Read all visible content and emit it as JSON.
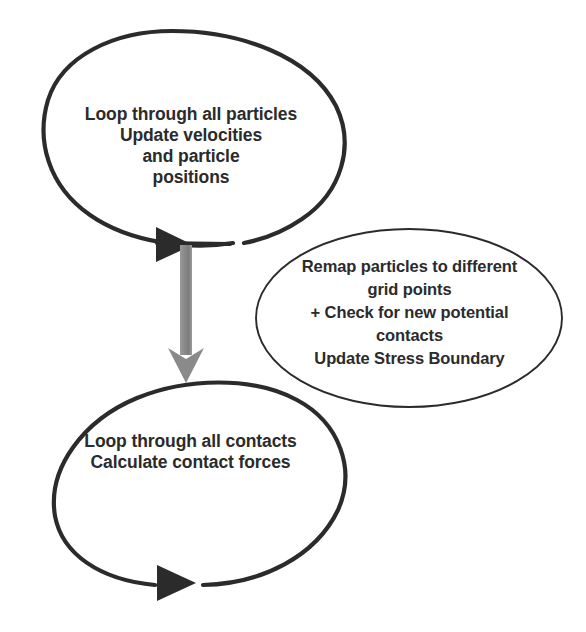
{
  "diagram": {
    "type": "flowchart",
    "background_color": "#ffffff",
    "stroke_color": "#2b2b2b",
    "arrow_gray_color": "#8a8a8a",
    "nodes": [
      {
        "id": "particle-loop",
        "shape": "ellipse",
        "text": "Loop through all particles\nUpdate velocities\nand particle\npositions",
        "lines": [
          "Loop through all particles",
          "Update velocities",
          "and particle",
          "positions"
        ],
        "cx": 191,
        "cy": 139,
        "rx": 154,
        "ry": 108,
        "stroke_width": 4
      },
      {
        "id": "remap",
        "shape": "ellipse",
        "text": "Remap particles to different\ngrid points\n+ Check for new potential\ncontacts\nUpdate Stress Boundary",
        "lines": [
          "Remap particles to different",
          "grid points",
          "+ Check for new potential",
          "contacts",
          "Update Stress Boundary"
        ],
        "cx": 409,
        "cy": 318,
        "rx": 153,
        "ry": 89,
        "stroke_width": 1.8
      },
      {
        "id": "contact-loop",
        "shape": "ellipse",
        "text": "Loop through all contacts\nCalculate contact forces",
        "lines": [
          "Loop through all contacts",
          "Calculate contact forces"
        ],
        "cx": 190,
        "cy": 490,
        "rx": 157,
        "ry": 107,
        "stroke_width": 4
      }
    ],
    "arrows": [
      {
        "id": "particle-loop-arrowhead",
        "kind": "loop-arrowhead",
        "direction": "right",
        "color": "#2b2b2b",
        "x": 157,
        "y": 235
      },
      {
        "id": "contact-loop-arrowhead",
        "kind": "loop-arrowhead",
        "direction": "right",
        "color": "#2b2b2b",
        "x": 158,
        "y": 565
      },
      {
        "id": "connector-arrow",
        "kind": "straight-arrow",
        "direction": "down",
        "color": "#8a8a8a",
        "from_x": 186,
        "from_y": 245,
        "to_x": 186,
        "to_y": 380
      }
    ]
  }
}
